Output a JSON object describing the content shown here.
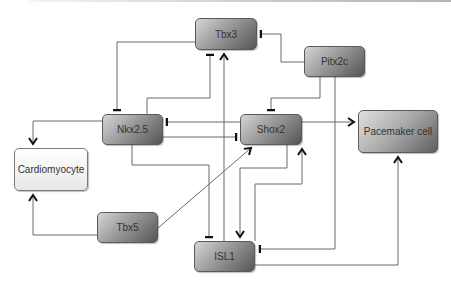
{
  "diagram": {
    "type": "gene regulatory network",
    "nodes": [
      {
        "id": "tbx3",
        "label": "Tbx3",
        "style": "gene"
      },
      {
        "id": "pitx2c",
        "label": "Pitx2c",
        "style": "gene"
      },
      {
        "id": "nkx25",
        "label": "Nkx2.5",
        "style": "gene"
      },
      {
        "id": "shox2",
        "label": "Shox2",
        "style": "gene"
      },
      {
        "id": "pacemaker",
        "label": "Pacemaker cell",
        "style": "cell-fate"
      },
      {
        "id": "cardiomyocyte",
        "label": "Cardiomyocyte",
        "style": "cell-fate-light"
      },
      {
        "id": "tbx5",
        "label": "Tbx5",
        "style": "gene"
      },
      {
        "id": "isl1",
        "label": "ISL1",
        "style": "gene"
      }
    ],
    "edges": [
      {
        "from": "Tbx3",
        "to": "Nkx2.5",
        "type": "inhibition"
      },
      {
        "from": "Nkx2.5",
        "to": "Tbx3",
        "type": "inhibition"
      },
      {
        "from": "Pitx2c",
        "to": "Tbx3",
        "type": "inhibition"
      },
      {
        "from": "Pitx2c",
        "to": "Shox2",
        "type": "inhibition"
      },
      {
        "from": "Pitx2c",
        "to": "ISL1",
        "type": "inhibition"
      },
      {
        "from": "Shox2",
        "to": "Nkx2.5",
        "type": "inhibition"
      },
      {
        "from": "Nkx2.5",
        "to": "Shox2",
        "type": "inhibition"
      },
      {
        "from": "Nkx2.5",
        "to": "Cardiomyocyte",
        "type": "activation"
      },
      {
        "from": "Nkx2.5",
        "to": "ISL1",
        "type": "inhibition"
      },
      {
        "from": "Shox2",
        "to": "Pacemaker cell",
        "type": "activation"
      },
      {
        "from": "Shox2",
        "to": "ISL1",
        "type": "activation"
      },
      {
        "from": "ISL1",
        "to": "Shox2",
        "type": "activation"
      },
      {
        "from": "ISL1",
        "to": "Tbx3",
        "type": "activation"
      },
      {
        "from": "ISL1",
        "to": "Pacemaker cell",
        "type": "activation"
      },
      {
        "from": "Tbx5",
        "to": "Cardiomyocyte",
        "type": "activation"
      },
      {
        "from": "Tbx5",
        "to": "Shox2",
        "type": "activation"
      }
    ],
    "colors": {
      "line": "#555555",
      "arrow": "#111111",
      "node_border": "#5a5a5a"
    }
  }
}
